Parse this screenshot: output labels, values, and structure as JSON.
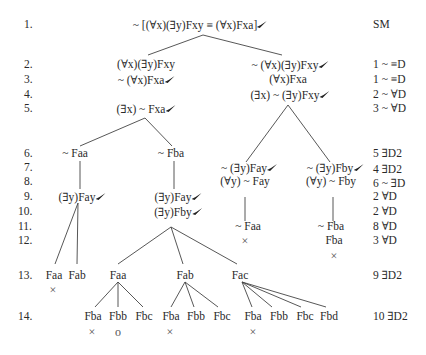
{
  "line_numbers": [
    "1.",
    "2.",
    "3.",
    "4.",
    "5.",
    "6.",
    "7.",
    "8.",
    "9.",
    "10.",
    "11.",
    "12.",
    "13.",
    "14."
  ],
  "justifications": {
    "r1": "SM",
    "r2": "1 ~ ≡D",
    "r3": "1 ~ ≡D",
    "r4": "2 ~ ∀D",
    "r5": "3 ~ ∀D",
    "r6": "5 ∃D2",
    "r7": "4 ∃D2",
    "r8": "6 ~ ∃D",
    "r9": "2 ∀D",
    "r10": "2 ∀D",
    "r11": "8 ∀D",
    "r12": "3 ∀D",
    "r13": "9 ∃D2",
    "r14": "10 ∃D2"
  },
  "tree": {
    "root": "~ [(∀x)(∃y)Fxy ≡ (∀x)Fxa]",
    "left": {
      "r2": "(∀x)(∃y)Fxy",
      "r3": "~ (∀x)Fxa",
      "r5": "(∃x) ~ Fxa",
      "b1": {
        "r6": "~ Faa",
        "r9": "(∃y)Fay",
        "r13": [
          "Faa",
          "Fab"
        ],
        "r13_marks": [
          "×",
          ""
        ]
      },
      "b2": {
        "r6": "~ Fba",
        "r9": "(∃y)Fay",
        "r10": "(∃y)Fby",
        "r13": [
          "Faa",
          "Fab",
          "Fac"
        ],
        "r14_faa": [
          "Fba",
          "Fbb",
          "Fbc"
        ],
        "r14_faa_marks": [
          "×",
          "o",
          ""
        ],
        "r14_fab": [
          "Fba",
          "Fbb",
          "Fbc"
        ],
        "r14_fab_marks": [
          "×",
          "",
          ""
        ],
        "r14_fac": [
          "Fba",
          "Fbb",
          "Fbc",
          "Fbd"
        ],
        "r14_fac_marks": [
          "×",
          "",
          "",
          ""
        ]
      }
    },
    "right": {
      "r2": "~ (∀x)(∃y)Fxy",
      "r3": "(∀x)Fxa",
      "r4": "(∃x) ~ (∃y)Fxy",
      "b1": {
        "r7": "~ (∃y)Fay",
        "r8": "(∀y) ~ Fay",
        "r11": "~ Faa",
        "mark": "×"
      },
      "b2": {
        "r7": "~ (∃y)Fby",
        "r8": "(∀y) ~ Fby",
        "r11": "~ Fba",
        "r12": "Fba",
        "mark": "×"
      }
    }
  },
  "check_icon": "check-mark"
}
